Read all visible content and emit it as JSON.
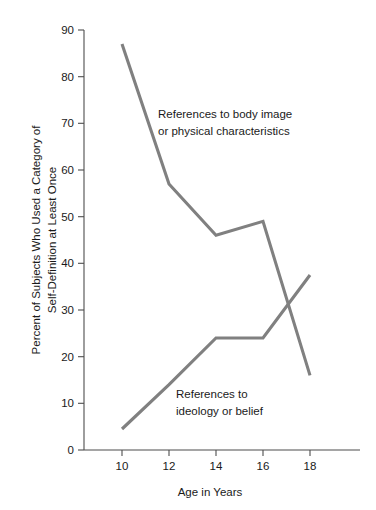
{
  "chart_data": {
    "type": "line",
    "title": "",
    "xlabel": "Age in Years",
    "ylabel": "Percent of Subjects Who Used a Category of Self-Definition at Least Once",
    "ylabel_line1": "Percent of Subjects Who Used a Category of",
    "ylabel_line2": "Self-Definition at Least Once",
    "x": [
      10,
      12,
      14,
      16,
      18
    ],
    "xticklabels": [
      "10",
      "12",
      "14",
      "16",
      "18"
    ],
    "yticklabels": [
      "0",
      "10",
      "20",
      "30",
      "40",
      "50",
      "60",
      "70",
      "80",
      "90"
    ],
    "yticks": [
      0,
      10,
      20,
      30,
      40,
      50,
      60,
      70,
      80,
      90
    ],
    "xlim": [
      9,
      19.5
    ],
    "ylim": [
      0,
      90
    ],
    "grid": false,
    "legend": "inline annotations",
    "series": [
      {
        "name": "References to body image or physical characteristics",
        "values": [
          87,
          57,
          46,
          49,
          16
        ],
        "color": "#808080"
      },
      {
        "name": "References to ideology or belief",
        "values": [
          4.5,
          14,
          24,
          24,
          37.5
        ],
        "color": "#808080"
      }
    ],
    "annotations": [
      {
        "id": "upper-annotation",
        "line1": "References to body image",
        "line2": "or physical characteristics"
      },
      {
        "id": "lower-annotation",
        "line1": "References to",
        "line2": "ideology or belief"
      }
    ]
  },
  "colors": {
    "line": "#808080",
    "axis": "#4d4d4d",
    "text": "#1a1a1a",
    "background": "#ffffff"
  }
}
